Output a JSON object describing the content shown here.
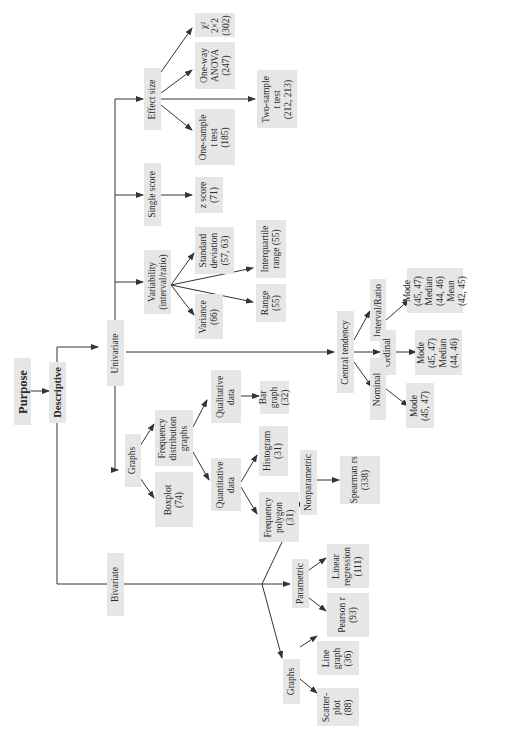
{
  "title": "Purpose",
  "nodes": {
    "purpose": "Purpose",
    "descriptive": "Descriptive",
    "univariate": "Univariate",
    "bivariate": "Bivariate",
    "effect_size": "Effect size",
    "chi_square": "χ²\n2×2\n(302)",
    "one_way_anova": "One-way\nANOVA\n(247)",
    "one_sample_t": "One-sample\nt test\n(185)",
    "two_sample_t": "Two-sample\nt test\n(212, 213)",
    "single_score": "Single score",
    "z_score": "z score\n(71)",
    "variability": "Variability\n(interval/ratio)",
    "standard_deviation": "Standard\ndeviation\n(57, 63)",
    "variance": "Variance\n(66)",
    "interquartile_range": "Interquartile\nrange (55)",
    "range": "Range\n(55)",
    "graphs_uni": "Graphs",
    "freq_dist_graphs": "Frequency\ndistribution\ngraphs",
    "boxplot": "Boxplot\n(74)",
    "qualitative_data": "Qualitative\ndata",
    "bar_graph": "Bar\ngraph\n(32)",
    "quantitative_data": "Quantitative\ndata",
    "histogram": "Histogram\n(31)",
    "frequency_polygon": "Frequency\npolygon\n(31)",
    "central_tendency": "Central tendency",
    "interval_ratio": "Interval/Ratio",
    "ordinal": "Ordinal",
    "nominal": "Nominal",
    "ir_measures": "Mode\n(45, 47)\nMedian\n(44, 46)\nMean\n(42, 45)",
    "ord_measures": "Mode\n(45, 47)\nMedian\n(44, 46)",
    "nom_measures": "Mode\n(45, 47)",
    "nonparametric": "Nonparametric",
    "spearman": "Spearman rs\n(338)",
    "parametric": "Parametric",
    "linear_regression": "Linear\nregression\n(111)",
    "pearson": "Pearson r\n(93)",
    "graphs_bi": "Graphs",
    "line_graph": "Line\ngraph\n(36)",
    "scatterplot": "Scatter-\nplot\n(88)"
  },
  "colors": {
    "box": "#e6e6e6",
    "line": "#333333",
    "text": "#2a2a2a"
  }
}
